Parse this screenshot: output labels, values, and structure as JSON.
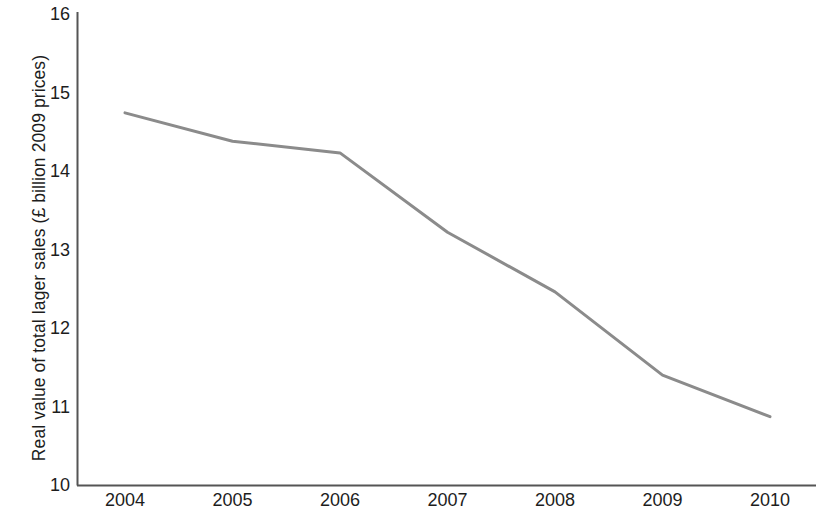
{
  "chart_data": {
    "type": "line",
    "title": "",
    "subtitle": "",
    "xlabel": "",
    "ylabel": "Real value of total lager sales (£ billion 2009 prices)",
    "x": [
      2004,
      2005,
      2006,
      2007,
      2008,
      2009,
      2010
    ],
    "xtick_labels": [
      "2004",
      "2005",
      "2006",
      "2007",
      "2008",
      "2009",
      "2010"
    ],
    "ytick_labels": [
      "16",
      "15",
      "14",
      "13",
      "12",
      "11",
      "10"
    ],
    "yticks": [
      16,
      15,
      14,
      13,
      12,
      11,
      10
    ],
    "ylim": [
      10,
      16
    ],
    "xlim": [
      2004,
      2010
    ],
    "grid": false,
    "legend": null,
    "series": [
      {
        "name": "Real value of total lager sales",
        "color": "#8b8b8b",
        "line_width": 3,
        "markers": false,
        "values": [
          14.74,
          14.38,
          14.23,
          13.22,
          12.46,
          11.4,
          10.87
        ]
      }
    ],
    "annotations": []
  },
  "axis": {
    "y_title": "Real value of total lager sales (£ billion 2009 prices)",
    "y_labels": [
      "16",
      "15",
      "14",
      "13",
      "12",
      "11",
      "10"
    ],
    "x_labels": [
      "2004",
      "2005",
      "2006",
      "2007",
      "2008",
      "2009",
      "2010"
    ],
    "axis_color": "#555555"
  }
}
